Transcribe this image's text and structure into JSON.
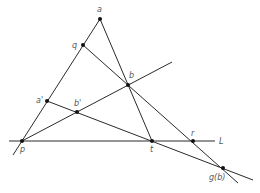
{
  "diagram": {
    "type": "projective-geometry-construction",
    "colors": {
      "line": "#2a2a2a",
      "point": "#111111",
      "label": "#555555",
      "background": "#ffffff"
    },
    "points": [
      {
        "id": "a",
        "label": "a",
        "x": 100,
        "y": 19,
        "lx": 97,
        "ly": 12
      },
      {
        "id": "q",
        "label": "q",
        "x": 83,
        "y": 45,
        "lx": 72,
        "ly": 48
      },
      {
        "id": "b",
        "label": "b",
        "x": 128,
        "y": 85,
        "lx": 129,
        "ly": 78
      },
      {
        "id": "a_prime",
        "label": "a'",
        "x": 47,
        "y": 101,
        "lx": 36,
        "ly": 103
      },
      {
        "id": "b_prime",
        "label": "b'",
        "x": 77,
        "y": 112,
        "lx": 74,
        "ly": 106
      },
      {
        "id": "p",
        "label": "p",
        "x": 22,
        "y": 141,
        "lx": 20,
        "ly": 152
      },
      {
        "id": "t",
        "label": "t",
        "x": 152,
        "y": 141,
        "lx": 150,
        "ly": 152
      },
      {
        "id": "r",
        "label": "r",
        "x": 193,
        "y": 141,
        "lx": 191,
        "ly": 136
      },
      {
        "id": "g_b",
        "label": "g(b)",
        "x": 223,
        "y": 168,
        "lx": 209,
        "ly": 180
      }
    ],
    "line_label": {
      "label": "L",
      "x": 219,
      "y": 144
    },
    "lines": [
      {
        "id": "L",
        "x1": 9,
        "y1": 141,
        "x2": 215,
        "y2": 141
      },
      {
        "id": "a-p",
        "x1": 100,
        "y1": 19,
        "x2": 13,
        "y2": 155
      },
      {
        "id": "a-t",
        "x1": 100,
        "y1": 19,
        "x2": 152,
        "y2": 141
      },
      {
        "id": "q-b-r-gb",
        "x1": 83,
        "y1": 45,
        "x2": 238,
        "y2": 183
      },
      {
        "id": "p-bp-b",
        "x1": 22,
        "y1": 141,
        "x2": 172,
        "y2": 62
      },
      {
        "id": "ap-bp-t-gb",
        "x1": 47,
        "y1": 101,
        "x2": 253,
        "y2": 180
      }
    ]
  }
}
